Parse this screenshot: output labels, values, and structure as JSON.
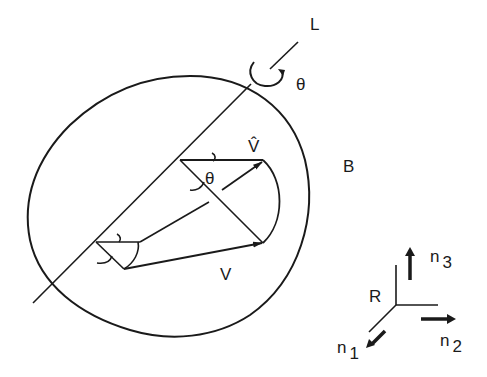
{
  "figure": {
    "stroke_color": "#1a1a1a",
    "background": "#ffffff"
  },
  "labels": {
    "axis": "L",
    "rotation_angle_top": "θ",
    "rotation_angle_inner": "θ",
    "rotated_vector": "V̂",
    "original_vector": "V",
    "body": "B",
    "frame": "R",
    "n1_base": "n",
    "n1_sub": "1",
    "n2_base": "n",
    "n2_sub": "2",
    "n3_base": "n",
    "n3_sub": "3"
  }
}
